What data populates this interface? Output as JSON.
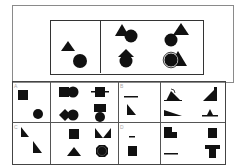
{
  "puzzle": {
    "type": "figure-reasoning",
    "question": {
      "given": {
        "shapes": [
          "triangle",
          "circle"
        ],
        "layout": "triangle upper-left, circle lower-right"
      },
      "sequence": [
        {
          "shapes": [
            "triangle",
            "circle"
          ],
          "relation": "triangle overlaps circle top-left"
        },
        {
          "shapes": [
            "circle",
            "triangle"
          ],
          "relation": "circle overlaps triangle top-right"
        },
        {
          "shapes": [
            "arrow-up",
            "circle"
          ],
          "relation": "upward arrow over circle"
        },
        {
          "shapes": [
            "circle-outlined",
            "triangle"
          ],
          "relation": "circle outlined overlapping triangle"
        }
      ]
    },
    "options": [
      {
        "label": "A",
        "given": {
          "shapes": [
            "square",
            "circle"
          ]
        },
        "figures": [
          {
            "shapes": [
              "square",
              "circle"
            ],
            "relation": "square beside circle"
          },
          {
            "shapes": [
              "square",
              "circle"
            ],
            "relation": "square with line through"
          },
          {
            "shapes": [
              "diamond",
              "circle"
            ],
            "relation": "diamond beside circle"
          },
          {
            "shapes": [
              "rectangle",
              "circle"
            ],
            "relation": "rectangle above circle"
          }
        ]
      },
      {
        "label": "B",
        "given": {
          "shapes": [
            "line",
            "right-triangle"
          ]
        },
        "figures": [
          {
            "shapes": [
              "semicircle-outline",
              "triangle"
            ],
            "relation": "semicircle over triangle"
          },
          {
            "shapes": [
              "trapezoid"
            ],
            "relation": "right trapezoid"
          },
          {
            "shapes": [
              "wedge"
            ],
            "relation": "flat wedge"
          },
          {
            "shapes": [
              "line",
              "small-triangle"
            ],
            "relation": "triangle on line"
          }
        ]
      },
      {
        "label": "C",
        "given": {
          "shapes": [
            "right-triangle",
            "right-triangle"
          ]
        },
        "figures": [
          {
            "shapes": [
              "square"
            ],
            "relation": "square"
          },
          {
            "shapes": [
              "bowtie"
            ],
            "relation": "two triangles meeting"
          },
          {
            "shapes": [
              "triangle"
            ],
            "relation": "triangle"
          },
          {
            "shapes": [
              "octagon-circle"
            ],
            "relation": "circle inside octagon"
          }
        ]
      },
      {
        "label": "D",
        "given": {
          "shapes": [
            "line",
            "square"
          ]
        },
        "figures": [
          {
            "shapes": [
              "l-block"
            ],
            "relation": "stepped block"
          },
          {
            "shapes": [
              "square"
            ],
            "relation": "square"
          },
          {
            "shapes": [
              "line"
            ],
            "relation": "horizontal line"
          },
          {
            "shapes": [
              "t-block"
            ],
            "relation": "T shape"
          }
        ]
      }
    ]
  },
  "colors": {
    "fill": "#111111",
    "border": "#444444",
    "outer_border": "#8a8a8a",
    "background": "#ffffff"
  }
}
